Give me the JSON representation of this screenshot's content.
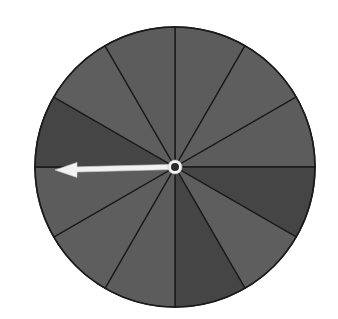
{
  "diagram": {
    "title": "Spinner with 12 equal sections",
    "type": "spinner",
    "center": {
      "x": 175,
      "y": 167
    },
    "radius": 140,
    "section_count": 12,
    "outline_color": "#1a1a1a",
    "background_color": "#ffffff",
    "sections": [
      {
        "index": 0,
        "start_deg": 0,
        "end_deg": 30,
        "shade": "medium",
        "color": "#5c5c5c"
      },
      {
        "index": 1,
        "start_deg": 30,
        "end_deg": 60,
        "shade": "medium",
        "color": "#5e5e5e"
      },
      {
        "index": 2,
        "start_deg": 60,
        "end_deg": 90,
        "shade": "medium",
        "color": "#5c5c5c"
      },
      {
        "index": 3,
        "start_deg": 90,
        "end_deg": 120,
        "shade": "dark",
        "color": "#454545"
      },
      {
        "index": 4,
        "start_deg": 120,
        "end_deg": 150,
        "shade": "medium",
        "color": "#5e5e5e"
      },
      {
        "index": 5,
        "start_deg": 150,
        "end_deg": 180,
        "shade": "dark",
        "color": "#454545"
      },
      {
        "index": 6,
        "start_deg": 180,
        "end_deg": 210,
        "shade": "medium",
        "color": "#5c5c5c"
      },
      {
        "index": 7,
        "start_deg": 210,
        "end_deg": 240,
        "shade": "medium",
        "color": "#5e5e5e"
      },
      {
        "index": 8,
        "start_deg": 240,
        "end_deg": 270,
        "shade": "medium",
        "color": "#5c5c5c"
      },
      {
        "index": 9,
        "start_deg": 270,
        "end_deg": 300,
        "shade": "dark",
        "color": "#454545"
      },
      {
        "index": 10,
        "start_deg": 300,
        "end_deg": 330,
        "shade": "medium",
        "color": "#5e5e5e"
      },
      {
        "index": 11,
        "start_deg": 330,
        "end_deg": 360,
        "shade": "medium",
        "color": "#5c5c5c"
      }
    ],
    "pointer": {
      "direction_deg": 270,
      "pointing": "left",
      "tip": {
        "x": 55,
        "y": 170
      },
      "color": "#f2f2f2",
      "outline_color": "#cfcfcf"
    },
    "hub": {
      "ring_color": "#f4f4f4",
      "dot_color": "#2a2a2a",
      "ring_radius": 7,
      "dot_radius": 4
    }
  }
}
